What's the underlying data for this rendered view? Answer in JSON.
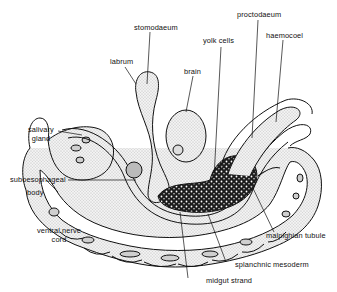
{
  "diagram": {
    "labels": {
      "stomodaeum": "stomodaeum",
      "labrum": "labrum",
      "brain": "brain",
      "yolk_cells": "yolk cells",
      "proctodaeum": "proctodaeum",
      "haemocoel": "haemocoel",
      "salivary_gland_1": "salivary",
      "salivary_gland_2": "gland",
      "suboesophageal_body_1": "suboesophageal",
      "suboesophageal_body_2": "body",
      "ventral_nerve_cord_1": "ventral  nerve",
      "ventral_nerve_cord_2": "cord",
      "malpighian_tubule": "malpighian  tubule",
      "splanchnic_mesoderm": "splanchnic  mesoderm",
      "midgut_strand": "midgut  strand"
    },
    "colors": {
      "line": "#111111",
      "stipple_fill": "#e6e6e6",
      "yolk_fill": "#2a2a2a",
      "background": "#ffffff"
    }
  }
}
